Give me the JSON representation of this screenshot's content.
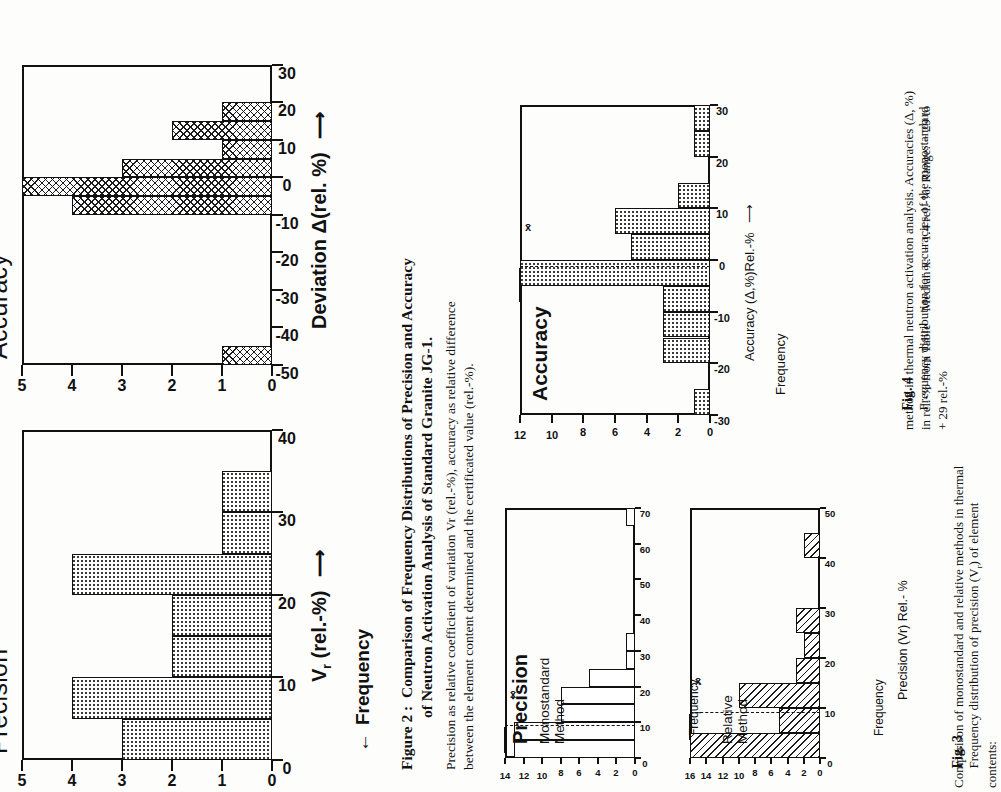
{
  "figure2": {
    "panels": {
      "precision": {
        "title": "Precision",
        "ylabel": "Frequency",
        "ylabel_arrow": "←",
        "xlabel": "V",
        "xlabel_sub": "r",
        "xlabel_rest": " (rel.-%)",
        "xlabel_arrow": "⟶"
      },
      "accuracy": {
        "title": "Accuracy",
        "xlabel": "Deviation  Δ(rel. %)",
        "xlabel_arrow": "⟶"
      }
    },
    "caption_title_line1": "Figure 2 :  Comparison of Frequency Distributions of Precision and Accuracy",
    "caption_title_line2": "of Neutron Activation Analysis of Standard Granite JG-1.",
    "caption_body_line1": "Precision as relative coefficient of variation Vr (rel.-%), accuracy as relative difference",
    "caption_body_line2": "between the element content determined and the certificated value (rel.-%)."
  },
  "figure3": {
    "title": "Precision",
    "panels": [
      {
        "name": "Monostandard\nMethod",
        "ylabel": "Frequency",
        "median_label": "x̄"
      },
      {
        "name": "Relative\nMethod",
        "ylabel": "Frequency",
        "median_label": "x̄"
      }
    ],
    "xlabel": "Precision (Vr) Rel.- %",
    "caption_fig": "Fig. 3",
    "caption_line1": "Frequency distribution of precision (V",
    "caption_line1_sub": "r",
    "caption_line1_end": ") of element contents:",
    "caption_line2": "Comparison of monostandard and relative methods in thermal"
  },
  "figure4": {
    "title": "Accuracy",
    "ylabel": "Frequency",
    "xlabel": "Accuracy (Δ,%)Rel.-%",
    "xlabel_arrow": "⟶",
    "median_label": "x̄",
    "caption_fig": "Fig. 4",
    "caption_line1": "Frequency distribution for accuracies of the monostandard",
    "caption_line2": "method in thermal neutron activation analysis. Accuracies (Δ, %)",
    "caption_line3": "in rel.-% from Table    Median x̄:  − 1.4 rel.-%; Range: − 29 to",
    "caption_line4": "+ 29 rel.-%"
  },
  "chart_data": [
    {
      "id": "fig2-precision",
      "type": "bar",
      "title": "Precision",
      "xlabel": "Vr (rel.-%)",
      "ylabel": "Frequency",
      "xlim": [
        0,
        40
      ],
      "ylim": [
        0,
        5
      ],
      "xticks": [
        0,
        10,
        20,
        30,
        40
      ],
      "yticks": [
        0,
        1,
        2,
        3,
        4,
        5
      ],
      "bin_width": 5,
      "bins": [
        {
          "x0": 0,
          "x1": 5,
          "value": 3
        },
        {
          "x0": 5,
          "x1": 10,
          "value": 4
        },
        {
          "x0": 10,
          "x1": 15,
          "value": 2
        },
        {
          "x0": 15,
          "x1": 20,
          "value": 2
        },
        {
          "x0": 20,
          "x1": 25,
          "value": 4
        },
        {
          "x0": 25,
          "x1": 30,
          "value": 1
        },
        {
          "x0": 30,
          "x1": 35,
          "value": 1
        }
      ],
      "fill": "dotted",
      "grid": false
    },
    {
      "id": "fig2-accuracy",
      "type": "bar",
      "title": "Accuracy",
      "xlabel": "Deviation Δ(rel. %)",
      "ylabel": "Frequency",
      "xlim": [
        -50,
        30
      ],
      "ylim": [
        0,
        5
      ],
      "xticks": [
        -50,
        -40,
        -30,
        -20,
        -10,
        0,
        10,
        20,
        30
      ],
      "yticks": [
        0,
        1,
        2,
        3,
        4,
        5
      ],
      "bin_width": 5,
      "bins": [
        {
          "x0": -50,
          "x1": -45,
          "value": 1
        },
        {
          "x0": -10,
          "x1": -5,
          "value": 4
        },
        {
          "x0": -5,
          "x1": 0,
          "value": 5
        },
        {
          "x0": 0,
          "x1": 5,
          "value": 3
        },
        {
          "x0": 5,
          "x1": 10,
          "value": 1
        },
        {
          "x0": 10,
          "x1": 15,
          "value": 2
        },
        {
          "x0": 15,
          "x1": 20,
          "value": 1
        }
      ],
      "fill": "crosshatch",
      "grid": false
    },
    {
      "id": "fig3-monostandard",
      "type": "bar",
      "title": "Monostandard Method",
      "xlabel": "Precision (Vr) Rel.- %",
      "ylabel": "Frequency",
      "xlim": [
        0,
        70
      ],
      "ylim": [
        0,
        14
      ],
      "xticks": [
        0,
        10,
        20,
        30,
        40,
        50,
        60,
        70
      ],
      "yticks": [
        0,
        2,
        4,
        6,
        8,
        10,
        12,
        14
      ],
      "bin_width": 5,
      "median": 9,
      "bins": [
        {
          "x0": 0,
          "x1": 5,
          "value": 13
        },
        {
          "x0": 5,
          "x1": 10,
          "value": 13
        },
        {
          "x0": 10,
          "x1": 15,
          "value": 8
        },
        {
          "x0": 15,
          "x1": 20,
          "value": 8
        },
        {
          "x0": 20,
          "x1": 25,
          "value": 5
        },
        {
          "x0": 25,
          "x1": 30,
          "value": 1
        },
        {
          "x0": 30,
          "x1": 35,
          "value": 1
        },
        {
          "x0": 65,
          "x1": 70,
          "value": 1
        }
      ],
      "fill": "outline",
      "grid": false
    },
    {
      "id": "fig3-relative",
      "type": "bar",
      "title": "Relative Method",
      "xlabel": "Precision (Vr) Rel.- %",
      "ylabel": "Frequency",
      "xlim": [
        0,
        50
      ],
      "ylim": [
        0,
        16
      ],
      "xticks": [
        0,
        10,
        20,
        30,
        40,
        50
      ],
      "yticks": [
        0,
        2,
        4,
        6,
        8,
        10,
        12,
        14,
        16
      ],
      "bin_width": 5,
      "median": 9,
      "bins": [
        {
          "x0": 0,
          "x1": 5,
          "value": 16
        },
        {
          "x0": 5,
          "x1": 10,
          "value": 5
        },
        {
          "x0": 10,
          "x1": 15,
          "value": 10
        },
        {
          "x0": 15,
          "x1": 20,
          "value": 3
        },
        {
          "x0": 20,
          "x1": 25,
          "value": 2
        },
        {
          "x0": 25,
          "x1": 30,
          "value": 3
        },
        {
          "x0": 40,
          "x1": 45,
          "value": 2
        }
      ],
      "fill": "hatch",
      "grid": false
    },
    {
      "id": "fig4-accuracy",
      "type": "bar",
      "title": "Accuracy",
      "xlabel": "Accuracy (Δ,%)Rel.-%",
      "ylabel": "Frequency",
      "xlim": [
        -30,
        30
      ],
      "ylim": [
        0,
        12
      ],
      "xticks": [
        -30,
        -20,
        -10,
        0,
        10,
        20,
        30
      ],
      "yticks": [
        0,
        2,
        4,
        6,
        8,
        10,
        12
      ],
      "bin_width": 5,
      "median": -1.4,
      "bins": [
        {
          "x0": -30,
          "x1": -25,
          "value": 1
        },
        {
          "x0": -20,
          "x1": -15,
          "value": 3
        },
        {
          "x0": -15,
          "x1": -10,
          "value": 3
        },
        {
          "x0": -10,
          "x1": -5,
          "value": 3
        },
        {
          "x0": -5,
          "x1": 0,
          "value": 12
        },
        {
          "x0": 0,
          "x1": 5,
          "value": 5
        },
        {
          "x0": 5,
          "x1": 10,
          "value": 6
        },
        {
          "x0": 10,
          "x1": 15,
          "value": 2
        },
        {
          "x0": 20,
          "x1": 25,
          "value": 1
        },
        {
          "x0": 25,
          "x1": 30,
          "value": 1
        }
      ],
      "fill": "dotted",
      "grid": false
    }
  ]
}
